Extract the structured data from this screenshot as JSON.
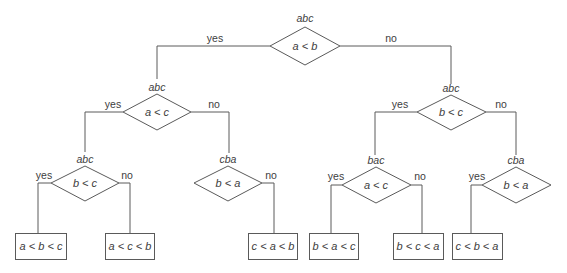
{
  "diagram": {
    "type": "decision-tree",
    "nodes": {
      "root": {
        "state": "abc",
        "condition": "a < b"
      },
      "l": {
        "state": "abc",
        "condition": "a < c"
      },
      "ll": {
        "state": "abc",
        "condition": "b < c"
      },
      "lr": {
        "state": "cba",
        "condition": "b < a"
      },
      "r": {
        "state": "abc",
        "condition": "b < c"
      },
      "rl": {
        "state": "bac",
        "condition": "a < c"
      },
      "rr": {
        "state": "cba",
        "condition": "b < a"
      }
    },
    "leaves": [
      "a < b < c",
      "a < c < b",
      "c < a < b",
      "b < a < c",
      "b < c < a",
      "c < b < a"
    ],
    "labels": {
      "yes": "yes",
      "no": "no"
    }
  }
}
